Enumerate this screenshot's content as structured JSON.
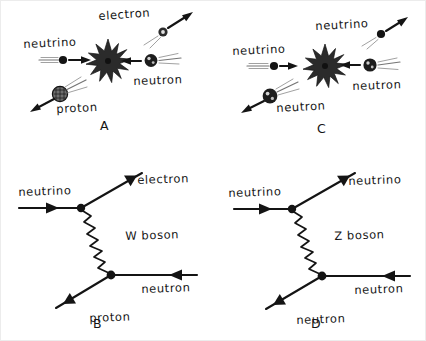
{
  "figure": {
    "title": "",
    "background_color": "#ffffff",
    "ink_color": "#141414",
    "border_color": "#ececec"
  },
  "panels": [
    {
      "id": "A",
      "letter": "A",
      "type": "collision-cartoon",
      "description": "charged current neutrino-neutron collision cartoon",
      "labels": [
        {
          "name": "neutrino",
          "text": "neutrino"
        },
        {
          "name": "electron",
          "text": "electron"
        },
        {
          "name": "neutron",
          "text": "neutron"
        },
        {
          "name": "proton",
          "text": "proton"
        }
      ],
      "particles": [
        {
          "name": "neutrino",
          "glyph": "small-dot",
          "direction": "right"
        },
        {
          "name": "electron",
          "glyph": "small-ringed-dot",
          "direction": "up-right"
        },
        {
          "name": "neutron",
          "glyph": "dark-nucleon",
          "direction": "left"
        },
        {
          "name": "proton",
          "glyph": "hatched-nucleon",
          "direction": "down-left"
        }
      ],
      "has_starburst": true
    },
    {
      "id": "C",
      "letter": "C",
      "type": "collision-cartoon",
      "description": "neutral current neutrino-neutron collision cartoon",
      "labels": [
        {
          "name": "neutrino-in",
          "text": "neutrino"
        },
        {
          "name": "neutrino-out",
          "text": "neutrino"
        },
        {
          "name": "neutron-in",
          "text": "neutron"
        },
        {
          "name": "neutron-out",
          "text": "neutron"
        }
      ],
      "particles": [
        {
          "name": "neutrino-in",
          "glyph": "small-dot",
          "direction": "right"
        },
        {
          "name": "neutrino-out",
          "glyph": "small-dot",
          "direction": "up-right"
        },
        {
          "name": "neutron-in",
          "glyph": "dark-nucleon",
          "direction": "left"
        },
        {
          "name": "neutron-out",
          "glyph": "dark-nucleon",
          "direction": "down-left"
        }
      ],
      "has_starburst": true
    },
    {
      "id": "B",
      "letter": "B",
      "type": "feynman-diagram",
      "description": "charged current W boson exchange",
      "mediator": {
        "name": "w-boson",
        "text": "W boson",
        "line_style": "zigzag"
      },
      "legs": [
        {
          "name": "neutrino-in",
          "text": "neutrino",
          "position": "upper-left",
          "arrow": "right"
        },
        {
          "name": "electron-out",
          "text": "electron",
          "position": "upper-right",
          "arrow": "up-right"
        },
        {
          "name": "neutron-in",
          "text": "neutron",
          "position": "lower-right",
          "arrow": "left"
        },
        {
          "name": "proton-out",
          "text": "proton",
          "position": "lower-left",
          "arrow": "down-left"
        }
      ]
    },
    {
      "id": "D",
      "letter": "D",
      "type": "feynman-diagram",
      "description": "neutral current Z boson exchange",
      "mediator": {
        "name": "z-boson",
        "text": "Z boson",
        "line_style": "zigzag"
      },
      "legs": [
        {
          "name": "neutrino-in",
          "text": "neutrino",
          "position": "upper-left",
          "arrow": "right"
        },
        {
          "name": "neutrino-out",
          "text": "neutrino",
          "position": "upper-right",
          "arrow": "up-right"
        },
        {
          "name": "neutron-in",
          "text": "neutron",
          "position": "lower-right",
          "arrow": "left"
        },
        {
          "name": "neutron-out",
          "text": "neutron",
          "position": "lower-left",
          "arrow": "down-left"
        }
      ]
    }
  ]
}
